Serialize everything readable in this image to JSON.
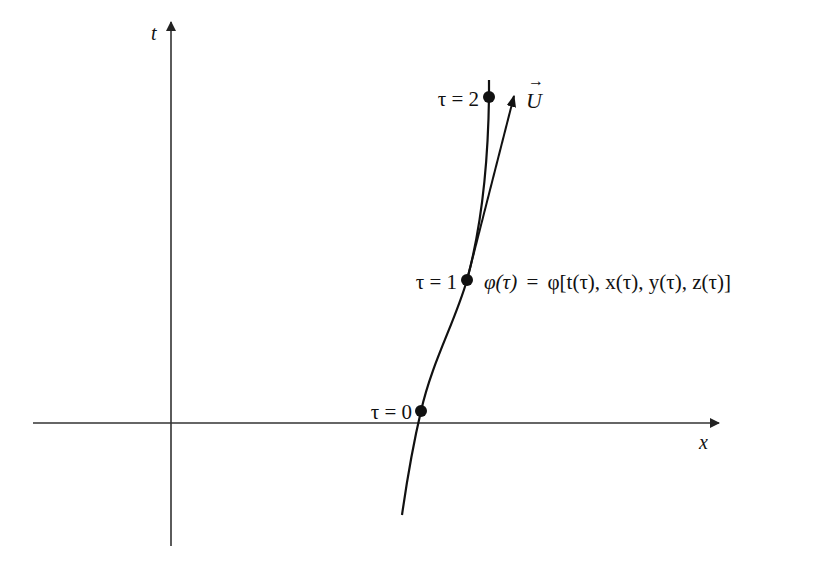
{
  "diagram": {
    "type": "spacetime worldline",
    "axes": {
      "vertical": {
        "label": "t"
      },
      "horizontal": {
        "label": "x"
      }
    },
    "worldline": {
      "points": [
        {
          "id": "tau0",
          "label": "τ = 0"
        },
        {
          "id": "tau1",
          "label": "τ = 1"
        },
        {
          "id": "tau2",
          "label": "τ = 2"
        }
      ],
      "parametrization": {
        "lhs": "φ(τ)",
        "eq": "=",
        "rhs": "φ[t(τ), x(τ), y(τ), z(τ)]"
      }
    },
    "tangent_vector": {
      "label": "U",
      "accent": "→"
    },
    "colors": {
      "ink": "#111111",
      "axis": "#333333",
      "background": "#ffffff"
    }
  }
}
